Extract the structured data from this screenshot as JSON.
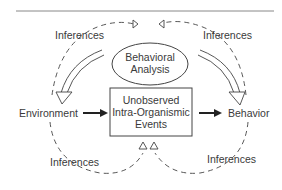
{
  "diagram": {
    "nodes": {
      "analysis": {
        "line1": "Behavioral",
        "line2": "Analysis"
      },
      "environment": "Environment",
      "events": {
        "line1": "Unobserved",
        "line2": "Intra-Organismic",
        "line3": "Events"
      },
      "behavior": "Behavior"
    },
    "labels": {
      "inferences_top_left": "Inferences",
      "inferences_top_right": "Inferences",
      "inferences_bottom_left": "Inferences",
      "inferences_bottom_right": "Inferences"
    },
    "colors": {
      "stroke": "#444444",
      "rule": "#888888"
    }
  }
}
